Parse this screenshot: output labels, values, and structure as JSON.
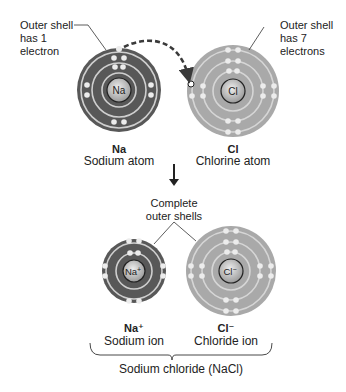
{
  "callouts": {
    "sodium_outer": "Outer shell\nhas 1\nelectron",
    "chlorine_outer": "Outer shell\nhas 7\nelectrons",
    "complete_shells": "Complete\nouter shells"
  },
  "atoms": [
    {
      "symbol": "Na",
      "name": "Sodium atom",
      "shells": [
        2,
        8,
        1
      ],
      "fill": "#585858"
    },
    {
      "symbol": "Cl",
      "name": "Chlorine atom",
      "shells": [
        2,
        8,
        7
      ],
      "fill": "#a9a9a9"
    }
  ],
  "ions": [
    {
      "symbol": "Na",
      "charge": "+",
      "label_symbol": "Na⁺",
      "name": "Sodium ion",
      "shells": [
        2,
        8
      ],
      "fill": "#585858"
    },
    {
      "symbol": "Cl",
      "charge": "−",
      "label_symbol": "Cl⁻",
      "name": "Chloride ion",
      "shells": [
        2,
        8,
        8
      ],
      "fill": "#a9a9a9"
    }
  ],
  "compound": {
    "label": "Sodium chloride (NaCl)"
  },
  "colors": {
    "dark_atom": "#585858",
    "light_atom": "#a9a9a9",
    "orbit": "#d4d4d4",
    "electron": "#e8e8e8",
    "nucleus": "#c8c8c8",
    "arrow": "#3a3a3a"
  }
}
